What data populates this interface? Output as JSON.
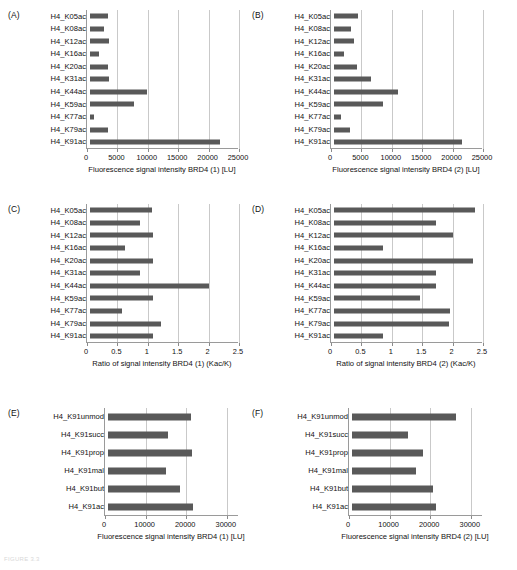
{
  "figure": {
    "caption": "FIGURE 3.3",
    "bar_color": "#595959",
    "grid_color": "#c9c9c9",
    "axis_color": "#9a9a9a"
  },
  "chart_data": [
    {
      "id": "A",
      "tag": "(A)",
      "type": "bar",
      "orientation": "horizontal",
      "title": "",
      "xlabel": "Fluorescence signal intensity BRD4 (1) [LU]",
      "ylabel": "",
      "xlim": [
        0,
        25000
      ],
      "xticks": [
        0,
        5000,
        10000,
        15000,
        20000,
        25000
      ],
      "xticklabels": [
        "0",
        "5000",
        "10000",
        "15000",
        "20000",
        "25000"
      ],
      "grid": true,
      "legend": "none",
      "categories": [
        "H4_K05ac",
        "H4_K08ac",
        "H4_K12ac",
        "H4_K16ac",
        "H4_K20ac",
        "H4_K31ac",
        "H4_K44ac",
        "H4_K59ac",
        "H4_K77ac",
        "H4_K79ac",
        "H4_K91ac"
      ],
      "values": [
        2950,
        2350,
        3050,
        1450,
        2950,
        3100,
        9400,
        7200,
        600,
        2900,
        21400
      ]
    },
    {
      "id": "B",
      "tag": "(B)",
      "type": "bar",
      "orientation": "horizontal",
      "title": "",
      "xlabel": "Fluorescence signal intensity BRD4 (2) [LU]",
      "ylabel": "",
      "xlim": [
        0,
        25000
      ],
      "xticks": [
        0,
        5000,
        10000,
        15000,
        20000,
        25000
      ],
      "xticklabels": [
        "0",
        "5000",
        "10000",
        "15000",
        "20000",
        "25000"
      ],
      "grid": true,
      "legend": "none",
      "categories": [
        "H4_K05ac",
        "H4_K08ac",
        "H4_K12ac",
        "H4_K16ac",
        "H4_K20ac",
        "H4_K31ac",
        "H4_K44ac",
        "H4_K59ac",
        "H4_K77ac",
        "H4_K79ac",
        "H4_K91ac"
      ],
      "values": [
        3900,
        2750,
        3250,
        1600,
        3800,
        6100,
        10600,
        8050,
        1100,
        2650,
        21000
      ]
    },
    {
      "id": "C",
      "tag": "(C)",
      "type": "bar",
      "orientation": "horizontal",
      "title": "",
      "xlabel": "Ratio of signal intensity BRD4 (1) (Kac/K)",
      "ylabel": "",
      "xlim": [
        0,
        2.5
      ],
      "xticks": [
        0,
        0.5,
        1,
        1.5,
        2,
        2.5
      ],
      "xticklabels": [
        "0",
        "0.5",
        "1",
        "1.5",
        "2",
        "2.5"
      ],
      "grid": true,
      "legend": "none",
      "categories": [
        "H4_K05ac",
        "H4_K08ac",
        "H4_K12ac",
        "H4_K16ac",
        "H4_K20ac",
        "H4_K31ac",
        "H4_K44ac",
        "H4_K59ac",
        "H4_K77ac",
        "H4_K79ac",
        "H4_K91ac"
      ],
      "values": [
        1.02,
        0.82,
        1.04,
        0.58,
        1.03,
        0.82,
        1.95,
        1.03,
        0.52,
        1.16,
        1.04
      ]
    },
    {
      "id": "D",
      "tag": "(D)",
      "type": "bar",
      "orientation": "horizontal",
      "title": "",
      "xlabel": "Ratio of signal intensity BRD4 (2) (Kac/K)",
      "ylabel": "",
      "xlim": [
        0,
        2.5
      ],
      "xticks": [
        0,
        0.5,
        1,
        1.5,
        2,
        2.5
      ],
      "xticklabels": [
        "0",
        "0.5",
        "1",
        "1.5",
        "2",
        "2.5"
      ],
      "grid": true,
      "legend": "none",
      "categories": [
        "H4_K05ac",
        "H4_K08ac",
        "H4_K12ac",
        "H4_K16ac",
        "H4_K20ac",
        "H4_K31ac",
        "H4_K44ac",
        "H4_K59ac",
        "H4_K77ac",
        "H4_K79ac",
        "H4_K91ac"
      ],
      "values": [
        2.32,
        1.67,
        1.95,
        0.8,
        2.28,
        1.67,
        1.68,
        1.42,
        1.9,
        1.89,
        0.8
      ]
    },
    {
      "id": "E",
      "tag": "(E)",
      "type": "bar",
      "orientation": "horizontal",
      "title": "",
      "xlabel": "Fluorescence signal intensity BRD4 (1) [LU]",
      "ylabel": "",
      "xlim": [
        0,
        33000
      ],
      "xticks": [
        0,
        10000,
        20000,
        30000
      ],
      "xticklabels": [
        "0",
        "10000",
        "20000",
        "30000"
      ],
      "grid": true,
      "legend": "none",
      "categories": [
        "H4_K91unmod",
        "H4_K91succ",
        "H4_K91prop",
        "H4_K91mal",
        "H4_K91but",
        "H4_K91ac"
      ],
      "values": [
        20500,
        14800,
        20600,
        14200,
        17800,
        21000
      ]
    },
    {
      "id": "F",
      "tag": "(F)",
      "type": "bar",
      "orientation": "horizontal",
      "title": "",
      "xlabel": "Fluorescence signal intensity BRD4 (2) [LU]",
      "ylabel": "",
      "xlim": [
        0,
        33000
      ],
      "xticks": [
        0,
        10000,
        20000,
        30000
      ],
      "xticklabels": [
        "0",
        "10000",
        "20000",
        "30000"
      ],
      "grid": true,
      "legend": "none",
      "categories": [
        "H4_K91unmod",
        "H4_K91succ",
        "H4_K91prop",
        "H4_K91mal",
        "H4_K91but",
        "H4_K91ac"
      ],
      "values": [
        25600,
        13700,
        17600,
        15700,
        19900,
        20800
      ]
    }
  ]
}
